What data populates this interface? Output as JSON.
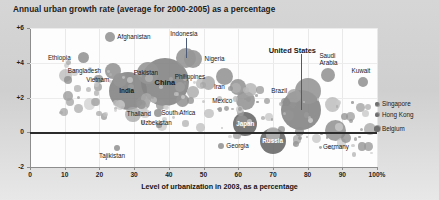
{
  "chart_data": {
    "type": "scatter",
    "title": "Annual urban growth rate (average for 2000-2005) as a percentage",
    "xlabel": "Level of urbanization in 2003, as a percentage",
    "ylabel": "",
    "xlim": [
      0,
      100
    ],
    "ylim": [
      -2,
      6
    ],
    "xticks": [
      "0",
      "10",
      "20",
      "30",
      "40",
      "50",
      "60",
      "70",
      "80",
      "90",
      "100%"
    ],
    "yticks": [
      "+6",
      "+4",
      "+2",
      "0",
      "-2"
    ],
    "grid": true,
    "legend_position": "none",
    "note": "Bubble area is proportional to urban population size",
    "points": [
      {
        "label": "Afghanistan",
        "x": 23.0,
        "y": 5.5,
        "size": 10,
        "emphasis": "normal",
        "label_pos": "right",
        "leader": false
      },
      {
        "label": "Ethiopia",
        "x": 15.5,
        "y": 4.3,
        "size": 11,
        "emphasis": "normal",
        "label_pos": "left",
        "leader": false
      },
      {
        "label": "Bangladesh",
        "x": 24.0,
        "y": 3.5,
        "size": 16,
        "emphasis": "normal",
        "label_pos": "left",
        "leader": false
      },
      {
        "label": "Vietnam",
        "x": 26.0,
        "y": 3.0,
        "size": 14,
        "emphasis": "normal",
        "label_pos": "left",
        "leader": false
      },
      {
        "label": "India",
        "x": 28.3,
        "y": 2.4,
        "size": 38,
        "emphasis": "bold",
        "label_pos": "center",
        "leader": false
      },
      {
        "label": "Pakistan",
        "x": 34.0,
        "y": 3.4,
        "size": 22,
        "emphasis": "normal",
        "label_pos": "center",
        "leader": false
      },
      {
        "label": "China",
        "x": 39.0,
        "y": 2.9,
        "size": 48,
        "emphasis": "bold-large",
        "label_pos": "center",
        "leader": false
      },
      {
        "label": "Thailand",
        "x": 32.0,
        "y": 1.6,
        "size": 9,
        "emphasis": "normal",
        "label_pos": "below",
        "leader": false
      },
      {
        "label": "Uzbekistan",
        "x": 37.0,
        "y": 1.1,
        "size": 8,
        "emphasis": "normal",
        "label_pos": "below",
        "leader": false
      },
      {
        "label": "Tajikistan",
        "x": 25.0,
        "y": -0.9,
        "size": 6,
        "emphasis": "normal",
        "label_pos": "below",
        "leader": false
      },
      {
        "label": "Indonesia",
        "x": 45.0,
        "y": 4.3,
        "size": 20,
        "emphasis": "normal",
        "label_pos": "above",
        "leader": true
      },
      {
        "label": "Nigeria",
        "x": 47.0,
        "y": 4.2,
        "size": 18,
        "emphasis": "normal",
        "label_pos": "right",
        "leader": false
      },
      {
        "label": "South Africa",
        "x": 44.0,
        "y": 1.8,
        "size": 13,
        "emphasis": "normal",
        "label_pos": "below",
        "leader": false
      },
      {
        "label": "Philippines",
        "x": 56.0,
        "y": 3.2,
        "size": 17,
        "emphasis": "normal",
        "label_pos": "left",
        "leader": false
      },
      {
        "label": "Iran",
        "x": 60.0,
        "y": 2.6,
        "size": 16,
        "emphasis": "normal",
        "label_pos": "left",
        "leader": false
      },
      {
        "label": "Mexico",
        "x": 62.0,
        "y": 1.8,
        "size": 19,
        "emphasis": "normal",
        "label_pos": "left",
        "leader": false
      },
      {
        "label": "Japan",
        "x": 62.0,
        "y": 0.5,
        "size": 24,
        "emphasis": "white-bold",
        "label_pos": "center",
        "leader": false
      },
      {
        "label": "Georgia",
        "x": 55.0,
        "y": -0.8,
        "size": 6,
        "emphasis": "normal",
        "label_pos": "right",
        "leader": false
      },
      {
        "label": "Russia",
        "x": 70.0,
        "y": -0.5,
        "size": 26,
        "emphasis": "white-bold",
        "label_pos": "center",
        "leader": false
      },
      {
        "label": "United States",
        "x": 78.0,
        "y": 1.3,
        "size": 40,
        "emphasis": "bold-large",
        "label_pos": "above",
        "leader": true
      },
      {
        "label": "Brazil",
        "x": 80.0,
        "y": 2.4,
        "size": 26,
        "emphasis": "normal",
        "label_pos": "left",
        "leader": false
      },
      {
        "label": "Saudi Arabia",
        "x": 86.0,
        "y": 3.3,
        "size": 14,
        "emphasis": "normal",
        "label_pos": "above",
        "leader": false
      },
      {
        "label": "Germany",
        "x": 88.0,
        "y": 0.1,
        "size": 21,
        "emphasis": "normal",
        "label_pos": "below",
        "leader": false
      },
      {
        "label": "Kuwait",
        "x": 96.0,
        "y": 2.9,
        "size": 10,
        "emphasis": "normal",
        "label_pos": "above",
        "leader": false
      },
      {
        "label": "Singapore",
        "x": 100.0,
        "y": 1.6,
        "size": 5,
        "emphasis": "normal",
        "label_pos": "right",
        "leader": false
      },
      {
        "label": "Hong Kong",
        "x": 100.0,
        "y": 1.0,
        "size": 5,
        "emphasis": "normal",
        "label_pos": "right",
        "leader": false
      },
      {
        "label": "Belgium",
        "x": 100.0,
        "y": 0.2,
        "size": 7,
        "emphasis": "normal",
        "label_pos": "right",
        "leader": false
      }
    ]
  },
  "colors": {
    "page_background": "#d2d2d2",
    "plot_background": "#fdfdfd",
    "zero_line": "#2c2c2c",
    "bubble_fill": "#9a9a9a",
    "bubble_dark": "#6e6e6e",
    "text": "#17181a",
    "leader_line": "#4a5a77"
  }
}
